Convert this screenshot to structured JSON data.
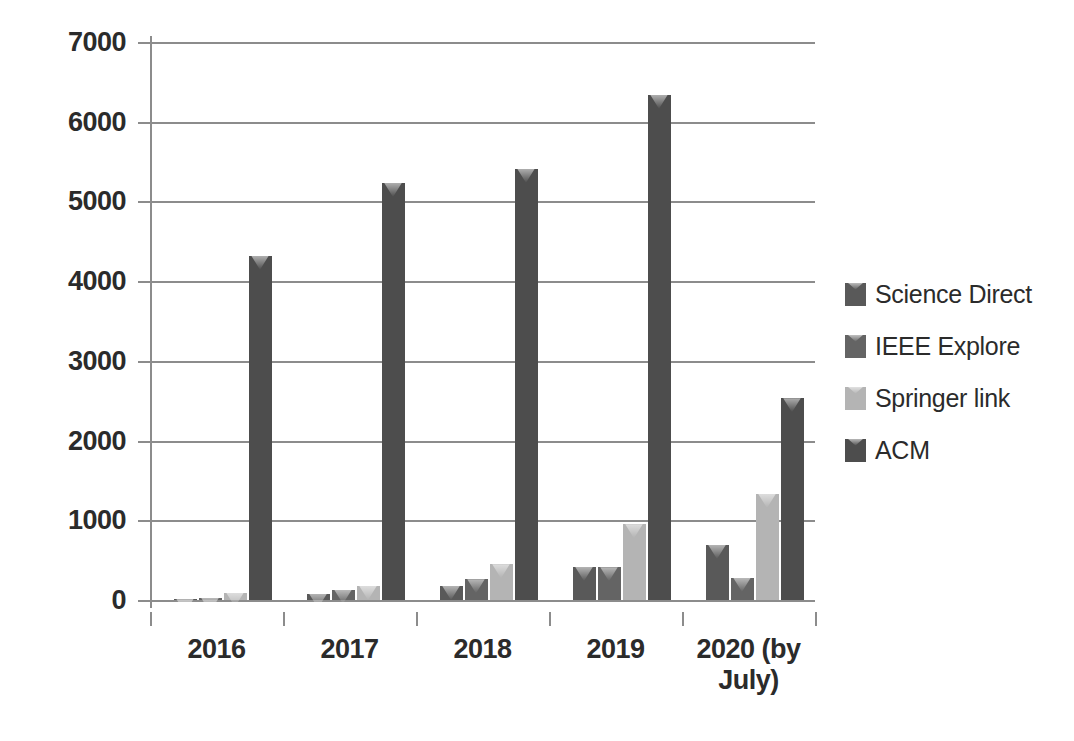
{
  "chart_data": {
    "type": "bar",
    "title": "",
    "subtitle": "",
    "xlabel": "",
    "ylabel": "",
    "grid": true,
    "legend_position": "right",
    "ylim": [
      0,
      7000
    ],
    "y_ticks": [
      7000,
      6000,
      5000,
      4000,
      3000,
      2000,
      1000,
      0
    ],
    "y_tick_labels": [
      "7000",
      "6000",
      "5000",
      "4000",
      "3000",
      "2000",
      "1000",
      "0"
    ],
    "categories": [
      "2016",
      "2017",
      "2018",
      "2019",
      "2020 (by July)"
    ],
    "series": [
      {
        "name": "Science Direct",
        "color": "#595959",
        "values": [
          15,
          75,
          175,
          415,
          690
        ]
      },
      {
        "name": "IEEE Explore",
        "color": "#646464",
        "values": [
          25,
          130,
          260,
          410,
          280
        ]
      },
      {
        "name": "Springer link",
        "color": "#b4b4b4",
        "values": [
          90,
          175,
          450,
          950,
          1330
        ]
      },
      {
        "name": "ACM",
        "color": "#4d4d4d",
        "values": [
          4320,
          5230,
          5410,
          6340,
          2530
        ]
      }
    ]
  },
  "legend": {
    "items": [
      {
        "label": "Science Direct",
        "color": "#595959"
      },
      {
        "label": "IEEE Explore",
        "color": "#646464"
      },
      {
        "label": "Springer link",
        "color": "#b4b4b4"
      },
      {
        "label": "ACM",
        "color": "#4d4d4d"
      }
    ]
  },
  "axes": {
    "y_tick_labels": [
      "7000",
      "6000",
      "5000",
      "4000",
      "3000",
      "2000",
      "1000",
      "0"
    ],
    "x_tick_labels": [
      "2016",
      "2017",
      "2018",
      "2019",
      "2020 (by\nJuly)"
    ]
  },
  "colors": {
    "gridline": "#8c8c8c",
    "text": "#2b2b2b",
    "background": "#ffffff"
  }
}
